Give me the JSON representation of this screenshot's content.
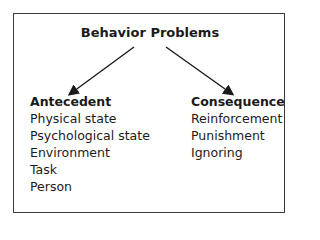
{
  "title": "Behavior Problems",
  "left": {
    "heading": "Antecedent",
    "items": [
      "Physical state",
      "Psychological state",
      "Environment",
      "Task",
      "Person"
    ]
  },
  "right": {
    "heading": "Consequence",
    "items": [
      "Reinforcement",
      "Punishment",
      "Ignoring"
    ]
  }
}
